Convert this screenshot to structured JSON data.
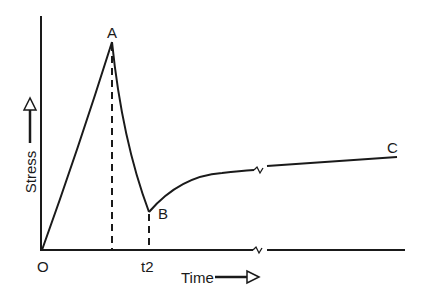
{
  "diagram": {
    "type": "stress-time curve",
    "axes": {
      "y_label": "Stress",
      "x_label": "Time",
      "origin_label": "O",
      "x_tick_label": "t2"
    },
    "points": [
      {
        "id": "A",
        "label": "A",
        "description": "peak stress"
      },
      {
        "id": "B",
        "label": "B",
        "description": "minimum stress at t2"
      },
      {
        "id": "C",
        "label": "C",
        "description": "long-term stress level"
      }
    ],
    "features": {
      "axis_break_symbol": "~",
      "dashed_lines": [
        "from A to time axis",
        "from B to t2"
      ]
    },
    "colors": {
      "line": "#1a1a1a",
      "background": "#ffffff"
    }
  }
}
